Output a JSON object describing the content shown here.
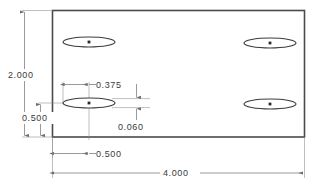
{
  "drawing": {
    "title": "Plate with four slots - dimensioned orthographic view",
    "units": "inches",
    "line_color": "#3c3c3c",
    "outline_color": "#4a4a4a",
    "dimension_color": "#6e6e6e",
    "text_color": "#3a3a3a",
    "background": "#ffffff",
    "part": {
      "name": "rectangular-plate",
      "width_value": "4.000",
      "height_value": "2.000"
    },
    "dimensions": [
      {
        "name": "overall-height",
        "label": "2.000",
        "orientation": "vertical",
        "position": "left-outer"
      },
      {
        "name": "slot-center-height",
        "label": "0.500",
        "orientation": "vertical",
        "position": "left-inner"
      },
      {
        "name": "slot-length",
        "label": "0.375",
        "orientation": "horizontal",
        "position": "upper-interior"
      },
      {
        "name": "slot-width",
        "label": "0.060",
        "orientation": "vertical",
        "position": "interior-right-of-slot"
      },
      {
        "name": "slot-center-offset",
        "label": "0.500",
        "orientation": "horizontal",
        "position": "bottom-inner"
      },
      {
        "name": "overall-width",
        "label": "4.000",
        "orientation": "horizontal",
        "position": "bottom-outer"
      }
    ],
    "slots": [
      {
        "name": "slot-top-left",
        "cx": 89,
        "cy": 42
      },
      {
        "name": "slot-top-right",
        "cx": 270,
        "cy": 43
      },
      {
        "name": "slot-bottom-left",
        "cx": 89,
        "cy": 103
      },
      {
        "name": "slot-bottom-right",
        "cx": 270,
        "cy": 104
      }
    ]
  }
}
